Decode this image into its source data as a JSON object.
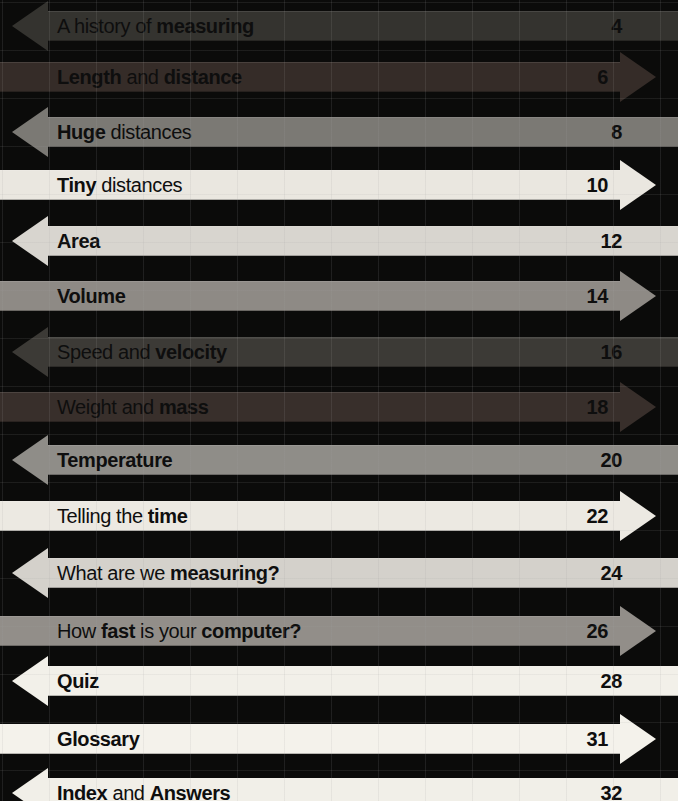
{
  "page": {
    "background_color": "#0b0b0a",
    "grid_line_color": "rgba(160,160,160,0.13)",
    "text_color": "#0e0e0e"
  },
  "contents": {
    "rows": [
      {
        "title_parts": [
          {
            "text": "A history of ",
            "bold": false
          },
          {
            "text": "measuring",
            "bold": true
          }
        ],
        "page": "4",
        "direction": "left",
        "color": "#34332f",
        "top": 11
      },
      {
        "title_parts": [
          {
            "text": "Length",
            "bold": true
          },
          {
            "text": " and ",
            "bold": false
          },
          {
            "text": "distance",
            "bold": true
          }
        ],
        "page": "6",
        "direction": "right",
        "color": "#352c28",
        "top": 62
      },
      {
        "title_parts": [
          {
            "text": "Huge",
            "bold": true
          },
          {
            "text": " distances",
            "bold": false
          }
        ],
        "page": "8",
        "direction": "left",
        "color": "#7b7974",
        "top": 117
      },
      {
        "title_parts": [
          {
            "text": "Tiny",
            "bold": true
          },
          {
            "text": " distances",
            "bold": false
          }
        ],
        "page": "10",
        "direction": "right",
        "color": "#eae7e0",
        "top": 170
      },
      {
        "title_parts": [
          {
            "text": "Area",
            "bold": true
          }
        ],
        "page": "12",
        "direction": "left",
        "color": "#d8d5cf",
        "top": 226
      },
      {
        "title_parts": [
          {
            "text": "Volume",
            "bold": true
          }
        ],
        "page": "14",
        "direction": "right",
        "color": "#8e8a85",
        "top": 281
      },
      {
        "title_parts": [
          {
            "text": "Speed and ",
            "bold": false
          },
          {
            "text": "velocity",
            "bold": true
          }
        ],
        "page": "16",
        "direction": "left",
        "color": "#3c3a36",
        "top": 337
      },
      {
        "title_parts": [
          {
            "text": "Weight and ",
            "bold": false
          },
          {
            "text": "mass",
            "bold": true
          }
        ],
        "page": "18",
        "direction": "right",
        "color": "#382f2b",
        "top": 392
      },
      {
        "title_parts": [
          {
            "text": "Temperature",
            "bold": true
          }
        ],
        "page": "20",
        "direction": "left",
        "color": "#8f8d88",
        "top": 445
      },
      {
        "title_parts": [
          {
            "text": "Telling the ",
            "bold": false
          },
          {
            "text": "time",
            "bold": true
          }
        ],
        "page": "22",
        "direction": "right",
        "color": "#ece9e2",
        "top": 501
      },
      {
        "title_parts": [
          {
            "text": "What are we ",
            "bold": false
          },
          {
            "text": "measuring?",
            "bold": true
          }
        ],
        "page": "24",
        "direction": "left",
        "color": "#d4d1cb",
        "top": 558
      },
      {
        "title_parts": [
          {
            "text": "How ",
            "bold": false
          },
          {
            "text": "fast",
            "bold": true
          },
          {
            "text": " is your ",
            "bold": false
          },
          {
            "text": "computer?",
            "bold": true
          }
        ],
        "page": "26",
        "direction": "right",
        "color": "#928e89",
        "top": 616
      },
      {
        "title_parts": [
          {
            "text": "Quiz",
            "bold": true
          }
        ],
        "page": "28",
        "direction": "left",
        "color": "#f2f0e9",
        "top": 666
      },
      {
        "title_parts": [
          {
            "text": "Glossary",
            "bold": true
          }
        ],
        "page": "31",
        "direction": "right",
        "color": "#f4f2eb",
        "top": 724
      },
      {
        "title_parts": [
          {
            "text": "Index",
            "bold": true
          },
          {
            "text": " and ",
            "bold": false
          },
          {
            "text": "Answers",
            "bold": true
          }
        ],
        "page": "32",
        "direction": "left",
        "color": "#f1efe8",
        "top": 778
      }
    ]
  }
}
